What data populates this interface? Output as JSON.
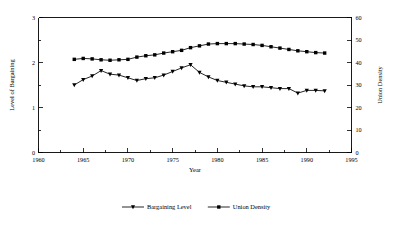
{
  "chart_data": {
    "type": "line",
    "title": "",
    "xlabel": "Year",
    "ylabel": "Level of Bargaining",
    "y2label": "Union Density",
    "xlim": [
      1960,
      1995
    ],
    "ylim": [
      0,
      3
    ],
    "y2lim": [
      0,
      60
    ],
    "grid": false,
    "legend_position": "bottom",
    "xticks": [
      1960,
      1965,
      1970,
      1975,
      1980,
      1985,
      1990,
      1995
    ],
    "xtick_labels": [
      "1960",
      "1965",
      "1970",
      "1975",
      "1980",
      "1985",
      "1990",
      "1995"
    ],
    "xminor_step": 1,
    "yticks": [
      0,
      1,
      2,
      3
    ],
    "ytick_labels": [
      "0",
      "1",
      "2",
      "3"
    ],
    "yminor_step": 0.5,
    "y2ticks": [
      0,
      10,
      20,
      30,
      40,
      50,
      60
    ],
    "y2tick_labels": [
      "0",
      "10",
      "20",
      "30",
      "40",
      "50",
      "60"
    ],
    "x": [
      1964,
      1965,
      1966,
      1967,
      1968,
      1969,
      1970,
      1971,
      1972,
      1973,
      1974,
      1975,
      1976,
      1977,
      1978,
      1979,
      1980,
      1981,
      1982,
      1983,
      1984,
      1985,
      1986,
      1987,
      1988,
      1989,
      1990,
      1991,
      1992
    ],
    "series": [
      {
        "name": "Bargaining Level",
        "axis": "left",
        "marker": "triangle-down",
        "values": [
          1.5,
          1.62,
          1.7,
          1.82,
          1.74,
          1.72,
          1.66,
          1.6,
          1.64,
          1.66,
          1.72,
          1.8,
          1.88,
          1.95,
          1.78,
          1.68,
          1.6,
          1.56,
          1.52,
          1.48,
          1.46,
          1.46,
          1.44,
          1.42,
          1.42,
          1.32,
          1.38,
          1.38,
          1.37
        ]
      },
      {
        "name": "Union Density",
        "axis": "right",
        "marker": "square",
        "values": [
          41.4,
          41.8,
          41.6,
          41.2,
          41.0,
          41.2,
          41.4,
          42.4,
          43.0,
          43.4,
          44.2,
          44.8,
          45.4,
          46.6,
          47.4,
          48.2,
          48.4,
          48.4,
          48.4,
          48.2,
          48.0,
          47.6,
          47.0,
          46.4,
          45.8,
          45.2,
          44.8,
          44.4,
          44.2
        ]
      }
    ],
    "legend": [
      {
        "label": "Bargaining Level",
        "marker": "triangle-down"
      },
      {
        "label": "Union Density",
        "marker": "square"
      }
    ]
  }
}
